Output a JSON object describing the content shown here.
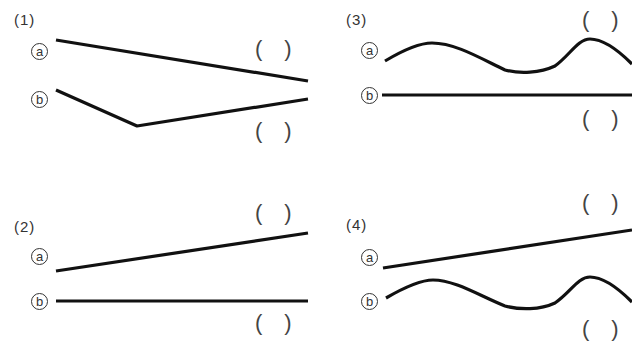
{
  "problems": [
    {
      "id": "1",
      "label": "(1)",
      "a_label": "a",
      "b_label": "b",
      "a_shape": "straight line sloping downward",
      "b_shape": "V-shaped bent line",
      "answer_a": "",
      "answer_b": ""
    },
    {
      "id": "2",
      "label": "(2)",
      "a_label": "a",
      "b_label": "b",
      "a_shape": "straight line sloping upward",
      "b_shape": "horizontal straight line",
      "answer_a": "",
      "answer_b": ""
    },
    {
      "id": "3",
      "label": "(3)",
      "a_label": "a",
      "b_label": "b",
      "a_shape": "wavy curve",
      "b_shape": "horizontal straight line",
      "answer_a": "",
      "answer_b": ""
    },
    {
      "id": "4",
      "label": "(4)",
      "a_label": "a",
      "b_label": "b",
      "a_shape": "straight line sloping upward",
      "b_shape": "wavy curve",
      "answer_a": "",
      "answer_b": ""
    }
  ],
  "paren_open": "(",
  "paren_close": ")",
  "colors": {
    "line": "#111111",
    "text": "#333333",
    "background": "#ffffff"
  }
}
